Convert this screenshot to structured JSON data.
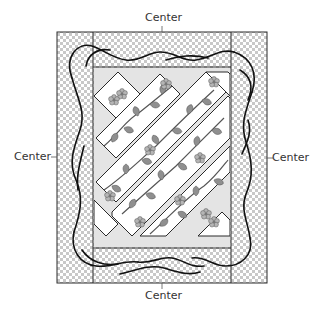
{
  "diagram": {
    "type": "quilt-layout",
    "labels": {
      "top": "Center",
      "bottom": "Center",
      "left": "Center",
      "right": "Center"
    },
    "colors": {
      "outline": "#2a2a2a",
      "checker_light": "#ffffff",
      "checker_dark": "#c8c8c8",
      "background_field": "#e4e4e4",
      "strip_fill": "#ffffff",
      "leaf": "#8a8a8a",
      "vine": "#555555",
      "border_vine": "#111111"
    },
    "parts": {
      "outer_border": "checkered border with curving vines",
      "center_field": "light grey field",
      "strips": "diagonal appliqué strips with leafy vines and flowers",
      "corner_blocks": "small on-point blocks with flower clusters"
    }
  }
}
